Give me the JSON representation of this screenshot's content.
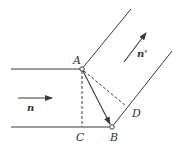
{
  "diagram": {
    "type": "refraction-wavefront",
    "points": {
      "A": {
        "label": "A",
        "x": 82,
        "y": 69
      },
      "B": {
        "label": "B",
        "x": 112,
        "y": 127
      },
      "C": {
        "label": "C",
        "x": 82,
        "y": 127
      },
      "D": {
        "label": "D",
        "x": 126,
        "y": 106
      }
    },
    "vectors": {
      "incident": {
        "label": "n"
      },
      "refracted": {
        "label": "n'"
      }
    },
    "edges": [
      {
        "from": "left",
        "to": "A",
        "style": "solid",
        "desc": "upper incident boundary"
      },
      {
        "from": "left",
        "to": "B",
        "style": "solid",
        "desc": "lower incident boundary"
      },
      {
        "from": "A",
        "to": "upper-right",
        "style": "solid",
        "desc": "upper refracted boundary"
      },
      {
        "from": "B",
        "to": "upper-right",
        "style": "solid",
        "desc": "lower refracted boundary"
      },
      {
        "from": "A",
        "to": "C",
        "style": "dashed"
      },
      {
        "from": "A",
        "to": "D",
        "style": "dashed"
      },
      {
        "from": "A",
        "to": "B",
        "style": "solid-arrow"
      }
    ],
    "colors": {
      "stroke": "#3a3a3a",
      "background": "#ffffff"
    }
  }
}
